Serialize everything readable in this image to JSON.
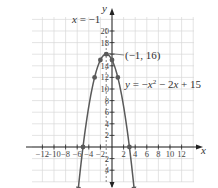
{
  "chart_data": {
    "type": "line",
    "title": "",
    "equation_label": "y = −x² − 2x + 15",
    "equation_parts": {
      "y": "y",
      "eq": " = −",
      "x": "x",
      "sq": "2",
      "rest": " − 2",
      "x2": "x",
      "tail": " + 15"
    },
    "axis_of_symmetry_label": "x = −1",
    "axis_of_symmetry_parts": {
      "x": "x",
      "rest": " = −1"
    },
    "vertex_label": "(−1, 16)",
    "xlabel": "x",
    "ylabel": "y",
    "xlim": [
      -14,
      15
    ],
    "ylim": [
      -6,
      22
    ],
    "grid": true,
    "x_ticks": [
      -12,
      -10,
      -8,
      -6,
      -4,
      -2,
      2,
      4,
      6,
      8,
      10,
      12
    ],
    "x_tick_labels": [
      "−12",
      "−10",
      "−8",
      "−6",
      "−4",
      "−2",
      "2",
      "4",
      "6",
      "8",
      "10",
      "12"
    ],
    "y_ticks": [
      20,
      18,
      16,
      14,
      12,
      10,
      8,
      6,
      4,
      2,
      -2,
      -4
    ],
    "y_tick_labels": [
      "20",
      "18",
      "",
      "14",
      "12",
      "10",
      "8",
      "6",
      "4",
      "2",
      "2",
      "4"
    ],
    "series": [
      {
        "name": "y = -x^2 - 2x + 15",
        "points": [
          [
            -5,
            0
          ],
          [
            -3,
            12
          ],
          [
            -2,
            15
          ],
          [
            -1,
            16
          ],
          [
            0,
            15
          ],
          [
            1,
            12
          ],
          [
            3,
            0
          ]
        ]
      }
    ],
    "vertex": [
      -1,
      16
    ],
    "axis_of_symmetry": -1,
    "colors": {
      "curve": "#5a5a5a",
      "grid": "#d9d9d9",
      "axis": "#222222",
      "dashed": "#777777"
    }
  }
}
